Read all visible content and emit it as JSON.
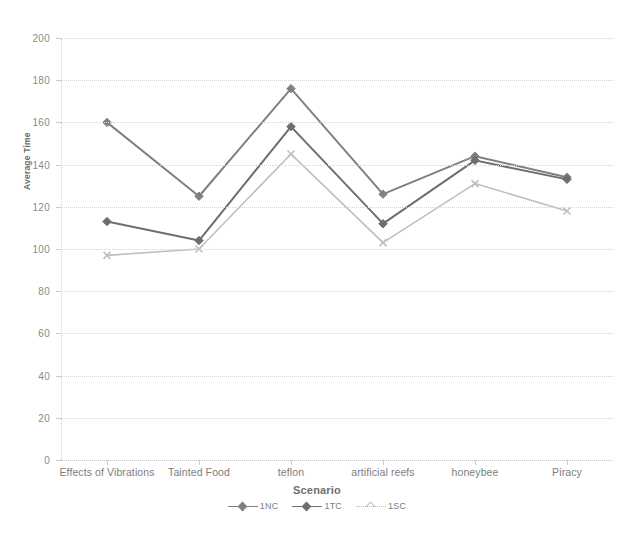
{
  "chart_data": {
    "type": "line",
    "title": "",
    "xlabel": "Scenario",
    "ylabel": "Average Time",
    "categories": [
      "Effects of Vibrations",
      "Tainted Food",
      "teflon",
      "artificial reefs",
      "honeybee",
      "Piracy"
    ],
    "yticks": [
      0,
      20,
      40,
      60,
      80,
      100,
      120,
      140,
      160,
      180,
      200
    ],
    "ylim": [
      0,
      200
    ],
    "grid": true,
    "legend_position": "bottom",
    "series": [
      {
        "name": "1NC",
        "color": "#808080",
        "marker": "diamond",
        "values": [
          160,
          125,
          176,
          126,
          144,
          134
        ]
      },
      {
        "name": "1TC",
        "color": "#6e6e6e",
        "marker": "diamond",
        "values": [
          113,
          104,
          158,
          112,
          142,
          133
        ]
      },
      {
        "name": "1SC",
        "color": "#bfbfbf",
        "marker": "x",
        "values": [
          97,
          100,
          145,
          103,
          131,
          118
        ]
      }
    ]
  },
  "axis": {
    "y_title": "Average Time",
    "x_title": "Scenario"
  }
}
